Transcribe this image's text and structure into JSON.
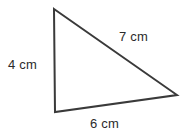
{
  "figure": {
    "kind": "triangle-diagram",
    "width": 186,
    "height": 138,
    "background_color": "#ffffff",
    "stroke_color": "#3a3a3a",
    "stroke_width": 2,
    "fill_color": "none"
  },
  "triangle": {
    "vertices": {
      "apex": {
        "x": 54,
        "y": 9
      },
      "bottom_left": {
        "x": 55,
        "y": 112
      },
      "right": {
        "x": 177,
        "y": 95
      }
    },
    "path": "M 54 9 L 177 95 L 55 112 Z"
  },
  "labels": {
    "left_side": "4 cm",
    "hypotenuse": "7 cm",
    "base": "6 cm"
  },
  "measurements": [
    {
      "side": "left",
      "value": 4,
      "unit": "cm",
      "text": "4 cm"
    },
    {
      "side": "hypotenuse",
      "value": 7,
      "unit": "cm",
      "text": "7 cm"
    },
    {
      "side": "base",
      "value": 6,
      "unit": "cm",
      "text": "6 cm"
    }
  ]
}
